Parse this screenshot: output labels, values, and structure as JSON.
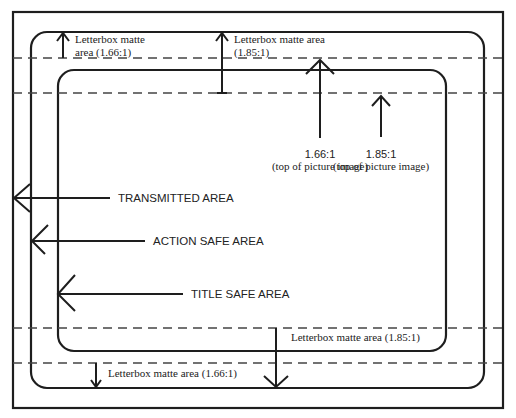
{
  "figure": {
    "label_fragment": "g"
  },
  "areas": {
    "transmitted": "TRANSMITTED AREA",
    "action_safe": "ACTION SAFE AREA",
    "title_safe": "TITLE SAFE AREA"
  },
  "letterbox": {
    "top_166_line1": "Letterbox matte",
    "top_166_line2": "area (1.66:1)",
    "top_185_line1": "Letterbox matte area",
    "top_185_line2": "(1.85:1)",
    "bottom_185": "Letterbox matte area (1.85:1)",
    "bottom_166": "Letterbox matte area (1.66:1)"
  },
  "picture_top": {
    "r166_ratio": "1.66:1",
    "r166_caption": "(top of picture image)",
    "r185_ratio": "1.85:1",
    "r185_caption": "(top of picture image)"
  },
  "colors": {
    "line": "#1e1e1e",
    "dash": "#444444",
    "background": "#ffffff"
  }
}
